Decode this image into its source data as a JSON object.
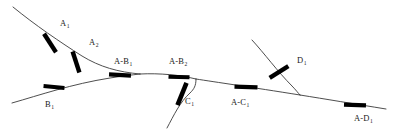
{
  "figure": {
    "type": "line-trace-diagram",
    "width": 395,
    "height": 133,
    "background_color": "#ffffff",
    "curve_color": "#3a3a3a",
    "tick_color": "#000000",
    "label_color": "#1a1a1a"
  },
  "curves": [
    {
      "id": "curve-a",
      "name": "A",
      "path": "M 13 7 C 35 25, 60 42, 82 56 C 100 67, 118 72, 140 74",
      "start": [
        13,
        7
      ],
      "end": [
        140,
        74
      ]
    },
    {
      "id": "curve-b",
      "name": "B",
      "path": "M 12 103 C 40 95, 72 84, 110 78 C 122 76, 132 75, 140 74",
      "start": [
        12,
        103
      ],
      "end": [
        140,
        74
      ]
    },
    {
      "id": "trunk-ab",
      "name": "A-B",
      "path": "M 140 74 C 160 73, 180 75, 196 79",
      "start": [
        140,
        74
      ],
      "end": [
        196,
        79
      ]
    },
    {
      "id": "curve-c",
      "name": "C",
      "path": "M 167 128 C 174 115, 180 102, 190 93 C 194 89, 196 86, 196 79",
      "start": [
        167,
        128
      ],
      "end": [
        196,
        79
      ]
    },
    {
      "id": "trunk-abc",
      "name": "A-C",
      "path": "M 196 79 C 215 82, 250 87, 300 95",
      "start": [
        196,
        79
      ],
      "end": [
        300,
        95
      ]
    },
    {
      "id": "curve-d",
      "name": "D",
      "path": "M 252 40 C 264 53, 278 72, 292 86 C 296 90, 298 93, 300 95",
      "start": [
        252,
        40
      ],
      "end": [
        300,
        95
      ]
    },
    {
      "id": "trunk-abcd",
      "name": "A-D",
      "path": "M 300 95 C 325 99, 355 104, 386 109",
      "start": [
        300,
        95
      ],
      "end": [
        386,
        109
      ]
    }
  ],
  "ticks": [
    {
      "id": "tick-a1",
      "at": [
        50,
        43
      ],
      "angle": 57,
      "length": 22,
      "thickness": 4.4
    },
    {
      "id": "tick-a2",
      "at": [
        76,
        62
      ],
      "angle": 72,
      "length": 22,
      "thickness": 4.4
    },
    {
      "id": "tick-b1",
      "at": [
        54,
        87
      ],
      "angle": 5,
      "length": 21,
      "thickness": 4.0
    },
    {
      "id": "tick-ab1",
      "at": [
        120,
        75
      ],
      "angle": 3,
      "length": 22,
      "thickness": 4.4
    },
    {
      "id": "tick-ab2",
      "at": [
        179,
        77
      ],
      "angle": 2,
      "length": 21,
      "thickness": 4.0
    },
    {
      "id": "tick-c1",
      "at": [
        182,
        94
      ],
      "angle": 112,
      "length": 24,
      "thickness": 4.6
    },
    {
      "id": "tick-ac1",
      "at": [
        246,
        87
      ],
      "angle": 2,
      "length": 23,
      "thickness": 4.4
    },
    {
      "id": "tick-d1",
      "at": [
        279,
        72
      ],
      "angle": 148,
      "length": 22,
      "thickness": 4.4
    },
    {
      "id": "tick-ad1",
      "at": [
        355,
        105
      ],
      "angle": 2,
      "length": 22,
      "thickness": 4.4
    }
  ],
  "labels": [
    {
      "id": "label-a1",
      "base": "A",
      "sub": "1",
      "x": 60,
      "y": 19
    },
    {
      "id": "label-a2",
      "base": "A",
      "sub": "2",
      "x": 89,
      "y": 38
    },
    {
      "id": "label-b1",
      "base": "B",
      "sub": "1",
      "x": 45,
      "y": 100
    },
    {
      "id": "label-ab1",
      "base": "A-B",
      "sub": "1",
      "x": 114,
      "y": 57
    },
    {
      "id": "label-ab2",
      "base": "A-B",
      "sub": "2",
      "x": 169,
      "y": 57
    },
    {
      "id": "label-c1",
      "base": "C",
      "sub": "1",
      "x": 185,
      "y": 97
    },
    {
      "id": "label-ac1",
      "base": "A-C",
      "sub": "1",
      "x": 231,
      "y": 98
    },
    {
      "id": "label-d1",
      "base": "D",
      "sub": "1",
      "x": 297,
      "y": 56
    },
    {
      "id": "label-ad1",
      "base": "A-D",
      "sub": "1",
      "x": 354,
      "y": 114
    }
  ]
}
